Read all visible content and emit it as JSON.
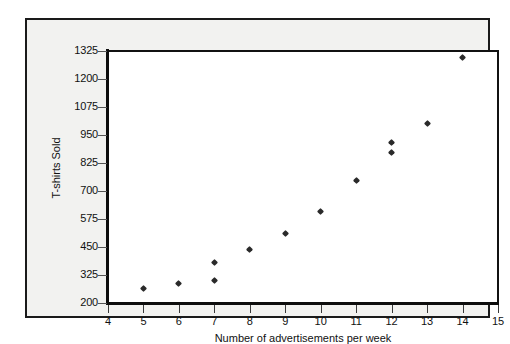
{
  "chart_data": {
    "type": "scatter",
    "title": "",
    "xlabel": "Number of advertisements per week",
    "ylabel": "T-shirts Sold",
    "xlim": [
      4,
      15
    ],
    "ylim": [
      200,
      1325
    ],
    "xticks": [
      4,
      5,
      6,
      7,
      8,
      9,
      10,
      11,
      12,
      13,
      14,
      15
    ],
    "yticks": [
      200,
      325,
      450,
      575,
      700,
      825,
      950,
      1075,
      1200,
      1325
    ],
    "grid": "horizontal",
    "legend": "none",
    "marker": "small-filled-diamond",
    "marker_color": "#2a2a2a",
    "points": [
      {
        "x": 5,
        "y": 265
      },
      {
        "x": 6,
        "y": 285
      },
      {
        "x": 7,
        "y": 300
      },
      {
        "x": 7,
        "y": 380
      },
      {
        "x": 8,
        "y": 440
      },
      {
        "x": 9,
        "y": 510
      },
      {
        "x": 10,
        "y": 610
      },
      {
        "x": 11,
        "y": 745
      },
      {
        "x": 12,
        "y": 870
      },
      {
        "x": 12,
        "y": 915
      },
      {
        "x": 13,
        "y": 1000
      },
      {
        "x": 14,
        "y": 1295
      }
    ]
  },
  "axes": {
    "y_tick_labels": [
      "1325",
      "1200",
      "1075",
      "950",
      "825",
      "700",
      "575",
      "450",
      "325",
      "200"
    ],
    "x_tick_labels": [
      "4",
      "5",
      "6",
      "7",
      "8",
      "9",
      "10",
      "11",
      "12",
      "13",
      "14",
      "15"
    ],
    "y_axis_title": "T-shirts Sold",
    "x_axis_title": "Number of advertisements per week"
  },
  "style": {
    "figure_background": "#ffffff",
    "panel_background": "#f2f2f0",
    "plot_background": "#ffffff",
    "axis_color": "#0d0d0d",
    "gridline_color": "#8a8a8a",
    "text_color": "#111111"
  }
}
